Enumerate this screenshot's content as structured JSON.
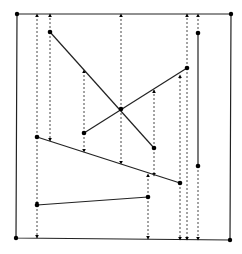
{
  "diagram": {
    "title": "",
    "boundary": {
      "corners": [
        [
          17,
          14
        ],
        [
          231,
          14
        ],
        [
          230,
          240
        ],
        [
          16,
          238
        ]
      ]
    },
    "segments": [
      {
        "id": "s1",
        "p1": [
          50,
          32
        ],
        "p2": [
          154,
          148
        ]
      },
      {
        "id": "s2",
        "p1": [
          84,
          133
        ],
        "p2": [
          187,
          68
        ]
      },
      {
        "id": "s3",
        "p1": [
          198,
          33
        ],
        "p2": [
          198,
          166
        ]
      },
      {
        "id": "s4",
        "p1": [
          37,
          137
        ],
        "p2": [
          180,
          183
        ]
      },
      {
        "id": "s5",
        "p1": [
          37,
          205
        ],
        "p2": [
          148,
          197
        ]
      }
    ],
    "intersection": [
      121,
      109
    ],
    "extensions": [
      {
        "x": 37,
        "from": 137,
        "to": 14,
        "dir": "up"
      },
      {
        "x": 37,
        "from": 137,
        "to": 205,
        "dir": "down"
      },
      {
        "x": 37,
        "from": 205,
        "to": 238,
        "dir": "down"
      },
      {
        "x": 50,
        "from": 32,
        "to": 14,
        "dir": "up"
      },
      {
        "x": 50,
        "from": 32,
        "to": 141,
        "dir": "down"
      },
      {
        "x": 84,
        "from": 133,
        "to": 70,
        "dir": "up"
      },
      {
        "x": 84,
        "from": 133,
        "to": 152,
        "dir": "down"
      },
      {
        "x": 121,
        "from": 109,
        "to": 14,
        "dir": "up"
      },
      {
        "x": 121,
        "from": 109,
        "to": 164,
        "dir": "down"
      },
      {
        "x": 148,
        "from": 197,
        "to": 174,
        "dir": "up"
      },
      {
        "x": 148,
        "from": 197,
        "to": 239,
        "dir": "down"
      },
      {
        "x": 154,
        "from": 148,
        "to": 90,
        "dir": "up"
      },
      {
        "x": 154,
        "from": 148,
        "to": 176,
        "dir": "down"
      },
      {
        "x": 180,
        "from": 183,
        "to": 75,
        "dir": "up"
      },
      {
        "x": 180,
        "from": 183,
        "to": 240,
        "dir": "down"
      },
      {
        "x": 187,
        "from": 68,
        "to": 14,
        "dir": "up"
      },
      {
        "x": 187,
        "from": 68,
        "to": 240,
        "dir": "down"
      },
      {
        "x": 198,
        "from": 33,
        "to": 14,
        "dir": "up"
      },
      {
        "x": 198,
        "from": 166,
        "to": 240,
        "dir": "down"
      }
    ],
    "colors": {
      "line": "#222222",
      "dashed": "#333333",
      "point": "#000000",
      "background": "#ffffff"
    }
  }
}
